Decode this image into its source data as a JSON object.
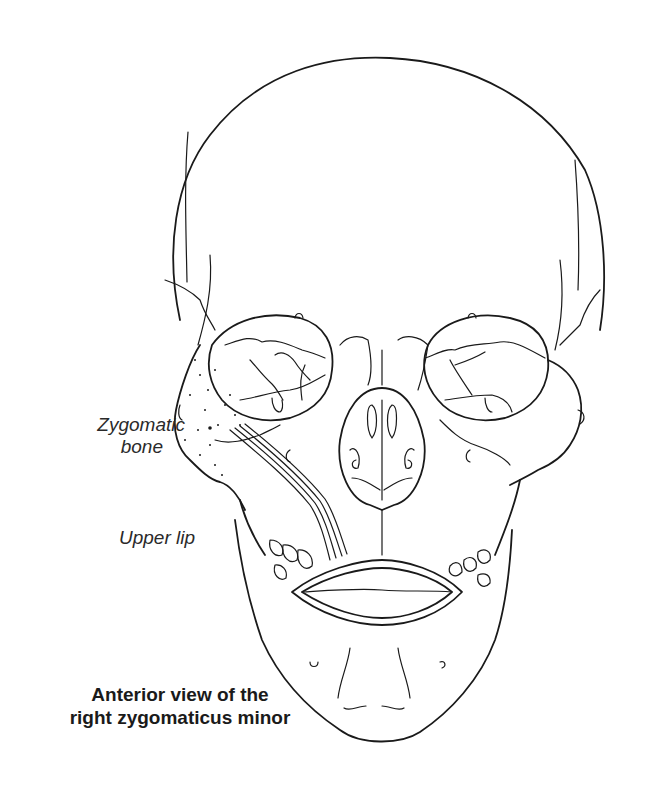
{
  "figure": {
    "title": "Anterior view of the right zygomaticus minor",
    "caption_lines": [
      "Anterior view of the",
      "right zygomaticus minor"
    ],
    "labels": {
      "zygomatic_bone": [
        "Zygomatic",
        "bone"
      ],
      "upper_lip": "Upper lip"
    },
    "colors": {
      "line": "#1a1a1a",
      "text": "#2a2a2a",
      "background": "#ffffff"
    }
  }
}
